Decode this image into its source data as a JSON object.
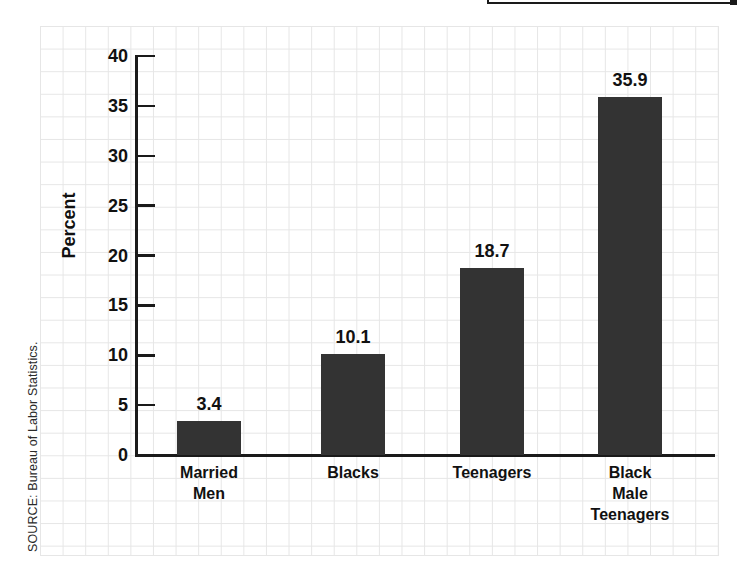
{
  "source_note": "SOURCE: Bureau of Labor Statistics.",
  "clipped_header": {
    "label": ""
  },
  "chart_data": {
    "type": "bar",
    "title": "",
    "xlabel": "",
    "ylabel": "Percent",
    "categories": [
      "Married\nMen",
      "Blacks",
      "Teenagers",
      "Black\nMale\nTeenagers"
    ],
    "values": [
      3.4,
      10.1,
      18.7,
      35.9
    ],
    "value_labels": [
      "3.4",
      "10.1",
      "18.7",
      "35.9"
    ],
    "ylim": [
      0,
      40
    ],
    "yticks": [
      0,
      5,
      10,
      15,
      20,
      25,
      30,
      35,
      40
    ],
    "ytick_labels": [
      "0",
      "5",
      "10",
      "15",
      "20",
      "25",
      "30",
      "35",
      "40"
    ],
    "grid": true,
    "grid_style": "graph-paper",
    "legend": null,
    "bar_color": "#333333",
    "axis_color": "#1a1a1a",
    "text_color": "#111111"
  }
}
